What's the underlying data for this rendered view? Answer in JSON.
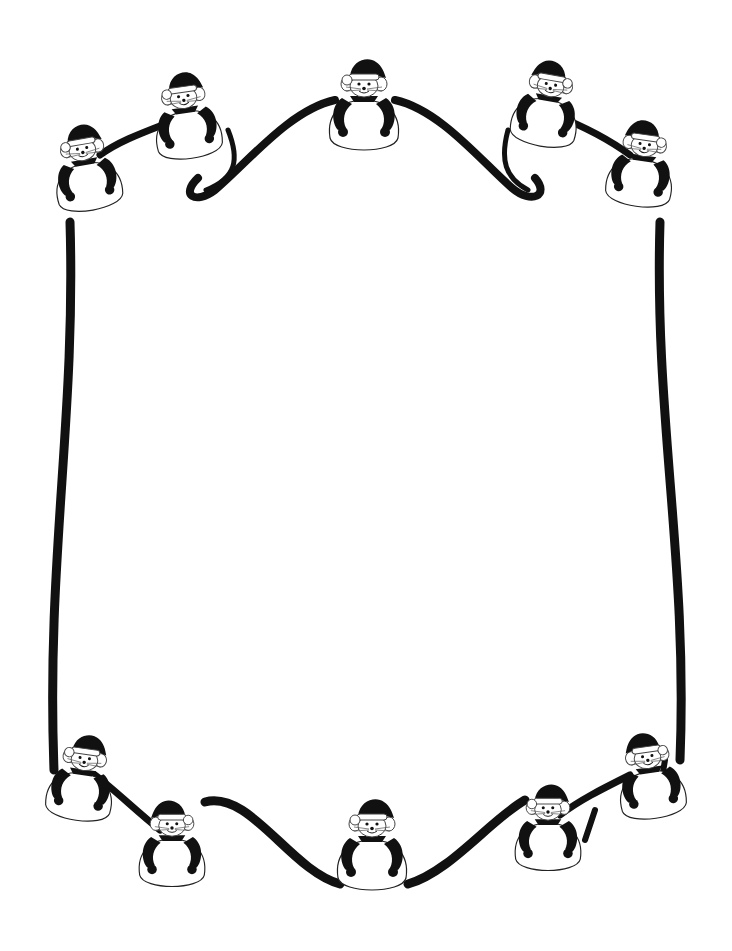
{
  "artwork": {
    "subject": "Christmas mice border frame",
    "style": "black and white clip art",
    "colors": {
      "ink": "#111111",
      "paper": "#ffffff",
      "outline": "#222222"
    },
    "ribbon": {
      "left_bar": "M70 222 C74 420 48 560 54 770",
      "right_bar": "M660 222 C656 420 690 560 680 760",
      "top_swag": "M218 178 C190 200 180 190 205 170 C250 140 300 95 345 98 M405 98 C450 95 500 140 535 175 C555 195 540 200 520 178",
      "bottom_swag": "M215 818 C255 810 300 880 345 882 M405 882 C450 870 490 820 520 800",
      "top_swag_left_tail": "M226 128 C238 160 240 180 210 192 C190 198 182 190 200 178",
      "top_swag_right_tail": "M512 130 C500 160 505 180 530 190 C550 198 556 188 540 176"
    },
    "mice": [
      {
        "id": "top-center",
        "x": 364,
        "y": 90,
        "scale": 1.0,
        "rotate": 0,
        "flip": false
      },
      {
        "id": "top-left-1",
        "x": 88,
        "y": 180,
        "scale": 0.95,
        "rotate": -10,
        "flip": false
      },
      {
        "id": "top-left-2",
        "x": 185,
        "y": 128,
        "scale": 0.95,
        "rotate": -8,
        "flip": false
      },
      {
        "id": "top-right-1",
        "x": 545,
        "y": 118,
        "scale": 0.95,
        "rotate": 10,
        "flip": true
      },
      {
        "id": "top-right-2",
        "x": 640,
        "y": 175,
        "scale": 0.95,
        "rotate": 8,
        "flip": true
      },
      {
        "id": "bottom-center",
        "x": 372,
        "y": 858,
        "scale": 1.0,
        "rotate": 0,
        "flip": false
      },
      {
        "id": "bottom-left-1",
        "x": 82,
        "y": 790,
        "scale": 0.95,
        "rotate": 8,
        "flip": false
      },
      {
        "id": "bottom-left-2",
        "x": 170,
        "y": 858,
        "scale": 0.95,
        "rotate": 0,
        "flip": true
      },
      {
        "id": "bottom-right-1",
        "x": 548,
        "y": 840,
        "scale": 0.95,
        "rotate": 0,
        "flip": false
      },
      {
        "id": "bottom-right-2",
        "x": 650,
        "y": 790,
        "scale": 0.95,
        "rotate": -8,
        "flip": true
      }
    ]
  }
}
